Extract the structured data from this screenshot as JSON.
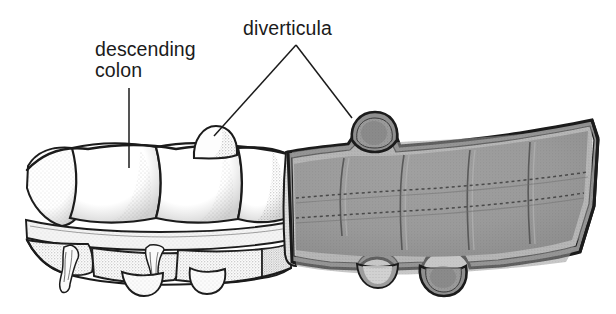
{
  "figure": {
    "background_color": "#ffffff",
    "ink_color": "#1b1b1b",
    "width": 616,
    "height": 314
  },
  "labels": [
    {
      "id": "descending-colon",
      "line1": "descending",
      "line2": "colon",
      "text_x": 95,
      "line1_y": 56,
      "line2_y": 77,
      "leader": {
        "x1": 129,
        "y1": 88,
        "x2": 129,
        "y2": 168
      }
    },
    {
      "id": "diverticula",
      "line1": "diverticula",
      "line2": "",
      "text_x": 243,
      "line1_y": 35,
      "line2_y": 35,
      "leader_apex": {
        "x": 296,
        "y": 45
      },
      "leader_left_end": {
        "x": 214,
        "y": 136
      },
      "leader_right_end": {
        "x": 352,
        "y": 118
      }
    }
  ],
  "anatomy": {
    "segments": [
      {
        "name": "exterior-serosal-segment",
        "fill": "#ffffff",
        "x_start": 25,
        "x_end": 287
      },
      {
        "name": "cutaway-lumen-segment",
        "fill": "#9b9b9b",
        "x_start": 287,
        "x_end": 596
      }
    ],
    "structures": [
      {
        "name": "haustra",
        "count": 4,
        "description": "sacculations of the colon wall"
      },
      {
        "name": "taenia-coli",
        "description": "longitudinal muscle band across mid wall"
      },
      {
        "name": "appendices-epiploicae",
        "count": 2,
        "description": "fatty appendages below taenia"
      },
      {
        "name": "semilunar-folds",
        "description": "dotted interior folds in cutaway"
      },
      {
        "name": "mucosal-lining",
        "fill": "#d8d8d8",
        "description": "pale wall rim in cutaway"
      }
    ],
    "diverticula": [
      {
        "name": "diverticulum-superior-left",
        "cx": 214,
        "cy": 143,
        "rx": 20,
        "ry": 18,
        "region": "exterior",
        "labeled": true
      },
      {
        "name": "diverticulum-superior-right",
        "cx": 367,
        "cy": 132,
        "rx": 21,
        "ry": 21,
        "region": "cutaway",
        "labeled": true
      },
      {
        "name": "diverticulum-inferior-left",
        "cx": 141,
        "cy": 282,
        "rx": 19,
        "ry": 15,
        "region": "exterior",
        "labeled": false
      },
      {
        "name": "diverticulum-inferior-mid",
        "cx": 207,
        "cy": 276,
        "rx": 17,
        "ry": 16,
        "region": "exterior",
        "labeled": false
      },
      {
        "name": "diverticulum-inferior-cut",
        "cx": 377,
        "cy": 272,
        "rx": 19,
        "ry": 15,
        "region": "cutaway",
        "labeled": false
      },
      {
        "name": "diverticulum-inferior-right",
        "cx": 437,
        "cy": 277,
        "rx": 20,
        "ry": 19,
        "region": "cutaway",
        "labeled": false
      }
    ]
  },
  "colors": {
    "ink": "#1b1b1b",
    "lumen_gray": "#9b9b9b",
    "lumen_gray_dark": "#8a8a8a",
    "wall_pale": "#dcdcdc",
    "stipple": "#6f6f6f",
    "white": "#ffffff"
  }
}
